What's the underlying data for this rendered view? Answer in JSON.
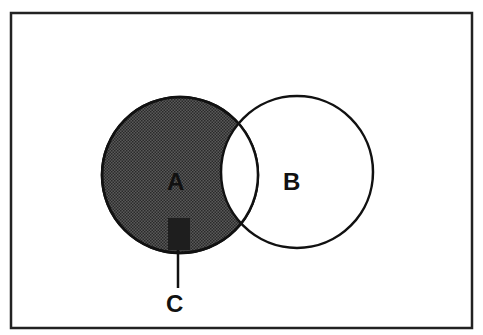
{
  "diagram": {
    "type": "venn",
    "labels": {
      "a": "A",
      "b": "B",
      "c": "C"
    },
    "colors": {
      "stroke": "#111111",
      "shade": "#4a4a4a",
      "shade_dark": "#222222",
      "background": "#ffffff"
    },
    "shaded_region": "A minus B",
    "callout": "C"
  }
}
